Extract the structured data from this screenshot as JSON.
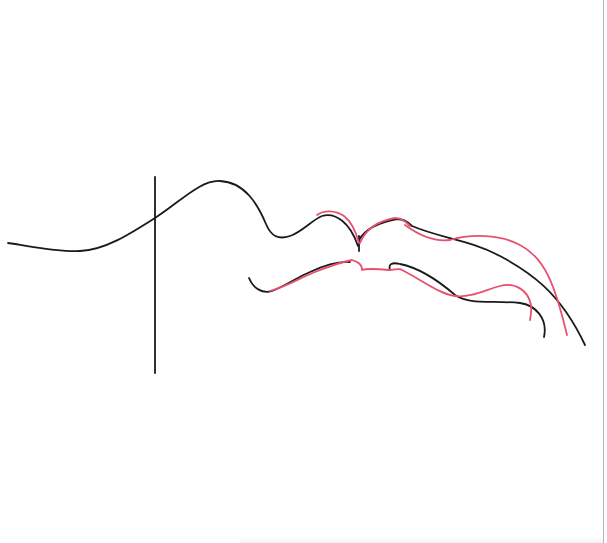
{
  "drawing": {
    "description": "Line sketch of a face profile / lips outline with black reference strokes and red traced strokes",
    "colors": {
      "background": "#ffffff",
      "black_stroke": "#1a1a1a",
      "red_stroke": "#e8506e",
      "border": "#b8b8b8"
    },
    "strokes": {
      "vertical_guide": "M155 177 L155 373",
      "black_profile": "M8 243 C30 246 55 252 80 251 C105 250 130 234 155 218 C180 202 200 180 220 181 C245 182 258 205 266 224 C271 236 278 240 290 236 C302 232 312 220 322 216 C335 212 350 222 358 246",
      "black_cusp_tick": "M359 236 L359 251",
      "black_upper_right": "M359 240 C366 228 380 222 397 219 C404 219 408 222 412 226 C440 238 470 240 500 256 C530 272 560 292 585 345",
      "black_lower_left": "M249 278 C253 288 262 294 272 291 C285 286 298 277 310 272 C325 265 338 261 350 262",
      "black_lower_right": "M390 270 C388 264 392 262 400 264 C420 268 440 282 455 295 C470 305 490 300 520 303 C535 305 548 318 544 337",
      "red_upper_left": "M317 215 C324 210 335 210 344 216 C352 222 356 232 359 243",
      "red_upper_mid": "M360 243 C366 228 378 221 395 218 C402 218 406 222 410 226",
      "red_upper_right": "M405 225 C420 236 435 242 450 240 C470 234 500 234 520 245 C545 258 555 285 567 335",
      "red_lower": "M270 291 C285 287 300 278 315 272 C330 266 342 262 352 260 C358 262 362 264 362 270 C368 268 378 269 388 270 C395 270 400 268 402 270 C425 282 440 294 455 296 C470 298 485 290 500 286 C515 282 528 290 531 305 C532 313 530 318 530 320"
    }
  }
}
